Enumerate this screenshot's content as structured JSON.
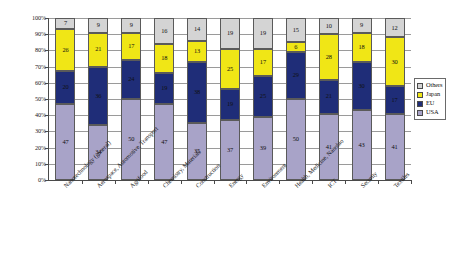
{
  "chart_data": {
    "type": "bar",
    "subtype": "stacked-100-percent",
    "title": "",
    "xlabel": "",
    "ylabel": "",
    "ylim": [
      0,
      100
    ],
    "ytick_labels": [
      "0%",
      "10%",
      "20%",
      "30%",
      "40%",
      "50%",
      "60%",
      "70%",
      "80%",
      "90%",
      "100%"
    ],
    "ytick_values": [
      0,
      10,
      20,
      30,
      40,
      50,
      60,
      70,
      80,
      90,
      100
    ],
    "grid": true,
    "legend_position": "right",
    "categories": [
      "Nanotechnology (general)",
      "Aerospace, Automotive, Transport",
      "Agrifood",
      "Chemistry, Materials",
      "Construction",
      "Energy",
      "Environment",
      "Health, Medicine, Nanobio",
      "ICT",
      "Security",
      "Textiles"
    ],
    "series": [
      {
        "name": "USA",
        "color": "#a8a3c8",
        "values": [
          47,
          34,
          50,
          47,
          35,
          37,
          39,
          50,
          41,
          43,
          41
        ]
      },
      {
        "name": "EU",
        "color": "#1f2d78",
        "values": [
          20,
          36,
          24,
          19,
          38,
          19,
          25,
          29,
          21,
          30,
          17
        ]
      },
      {
        "name": "Japan",
        "color": "#f0e616",
        "values": [
          26,
          21,
          17,
          18,
          13,
          25,
          17,
          6,
          28,
          18,
          30
        ]
      },
      {
        "name": "Others",
        "color": "#d4d4d4",
        "values": [
          7,
          9,
          9,
          16,
          14,
          19,
          19,
          15,
          10,
          9,
          12
        ]
      }
    ]
  },
  "legend": {
    "entries": [
      {
        "label": "Others",
        "color": "#d4d4d4"
      },
      {
        "label": "Japan",
        "color": "#f0e616"
      },
      {
        "label": "EU",
        "color": "#1f2d78"
      },
      {
        "label": "USA",
        "color": "#a8a3c8"
      }
    ]
  }
}
